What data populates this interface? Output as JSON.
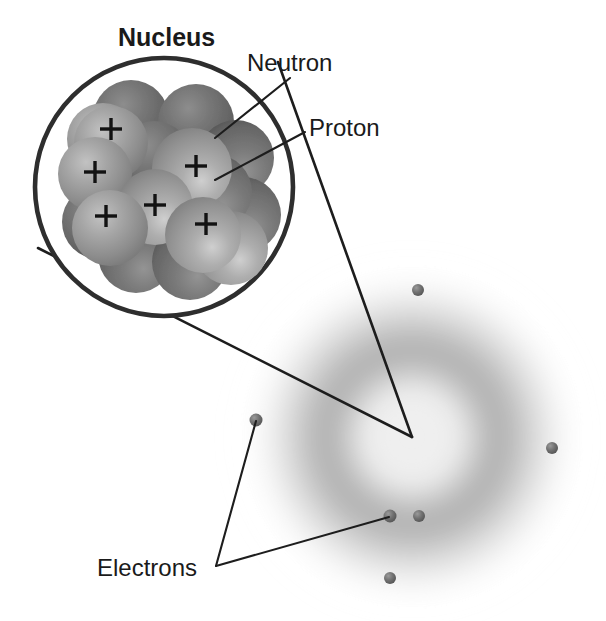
{
  "figure": {
    "background_color": "#ffffff",
    "width": 606,
    "height": 621
  },
  "labels": {
    "nucleus": "Nucleus",
    "neutron": "Neutron",
    "proton": "Proton",
    "electrons": "Electrons",
    "proton_charge_symbol": "+"
  },
  "colors": {
    "text": "#1a1a1a",
    "leader_line": "#1d1d1d",
    "nucleus_outline": "#2e2e2e",
    "proton_light": "#9a9a9a",
    "proton_mid": "#8b8b8b",
    "neutron_dark": "#6a6a6a",
    "neutron_darker": "#5c5c5c",
    "electron": "#6b6b6b",
    "cloud_gray": "#b9b9b9"
  },
  "nucleus_callout": {
    "circle": {
      "cx": 164,
      "cy": 187,
      "r": 129
    },
    "title_position": {
      "x": 118,
      "y": 46
    },
    "magnification_lines": [
      {
        "from": [
          38,
          248
        ],
        "to": [
          412,
          437
        ]
      },
      {
        "from": [
          278,
          62
        ],
        "to": [
          412,
          437
        ]
      }
    ]
  },
  "nucleons": {
    "proton_count_visible": 5,
    "back_layer": [
      {
        "x": 131,
        "y": 118,
        "r": 38,
        "kind": "neutron"
      },
      {
        "x": 196,
        "y": 122,
        "r": 38,
        "kind": "neutron"
      },
      {
        "x": 236,
        "y": 158,
        "r": 38,
        "kind": "neutron"
      },
      {
        "x": 243,
        "y": 215,
        "r": 38,
        "kind": "neutron"
      },
      {
        "x": 110,
        "y": 166,
        "r": 38,
        "kind": "neutron"
      },
      {
        "x": 99,
        "y": 222,
        "r": 37,
        "kind": "neutron"
      },
      {
        "x": 136,
        "y": 255,
        "r": 38,
        "kind": "neutron"
      },
      {
        "x": 190,
        "y": 262,
        "r": 38,
        "kind": "neutron"
      }
    ],
    "mid_layer": [
      {
        "x": 154,
        "y": 159,
        "r": 38,
        "kind": "neutron"
      },
      {
        "x": 214,
        "y": 192,
        "r": 38,
        "kind": "neutron"
      },
      {
        "x": 103,
        "y": 139,
        "r": 36,
        "kind": "proton",
        "plus": false
      },
      {
        "x": 231,
        "y": 248,
        "r": 37,
        "kind": "proton",
        "plus": false
      }
    ],
    "front_layer": [
      {
        "x": 111,
        "y": 143,
        "r": 37,
        "kind": "proton",
        "plus": true,
        "plus_x": 111,
        "plus_y": 129
      },
      {
        "x": 95,
        "y": 174,
        "r": 37,
        "kind": "proton",
        "plus": true,
        "plus_x": 95,
        "plus_y": 172
      },
      {
        "x": 192,
        "y": 168,
        "r": 40,
        "kind": "proton",
        "plus": true,
        "plus_x": 196,
        "plus_y": 166
      },
      {
        "x": 155,
        "y": 207,
        "r": 38,
        "kind": "proton",
        "plus": true,
        "plus_x": 155,
        "plus_y": 205
      },
      {
        "x": 110,
        "y": 228,
        "r": 38,
        "kind": "proton",
        "plus": true,
        "plus_x": 106,
        "plus_y": 216
      },
      {
        "x": 203,
        "y": 235,
        "r": 38,
        "kind": "proton",
        "plus": true,
        "plus_x": 206,
        "plus_y": 224
      }
    ]
  },
  "electron_cloud": {
    "center": {
      "x": 412,
      "y": 437
    },
    "outer_radius": 168,
    "ring_radius": 112,
    "inner_bright_radius": 58
  },
  "electrons": [
    {
      "id": "electron-top",
      "x": 418,
      "y": 290,
      "r": 6
    },
    {
      "id": "electron-right",
      "x": 552,
      "y": 448,
      "r": 6
    },
    {
      "id": "electron-left",
      "x": 256,
      "y": 420,
      "r": 6.5
    },
    {
      "id": "electron-bottom-left",
      "x": 390,
      "y": 516,
      "r": 6.5
    },
    {
      "id": "electron-bottom-mid",
      "x": 419,
      "y": 516,
      "r": 6
    },
    {
      "id": "electron-bottom",
      "x": 390,
      "y": 578,
      "r": 6
    }
  ],
  "leader_lines": {
    "neutron": {
      "from": [
        290,
        78
      ],
      "to": [
        215,
        138
      ]
    },
    "proton": {
      "from": [
        305,
        132
      ],
      "to": [
        215,
        180
      ]
    },
    "electrons_vertex": [
      216,
      566
    ],
    "electrons_branches": [
      {
        "from": [
          216,
          566
        ],
        "to": [
          256,
          421
        ]
      },
      {
        "from": [
          216,
          566
        ],
        "to": [
          389,
          517
        ]
      }
    ]
  },
  "label_positions": {
    "neutron": {
      "x": 247,
      "y": 71
    },
    "proton": {
      "x": 309,
      "y": 136
    },
    "electrons": {
      "x": 97,
      "y": 576
    }
  }
}
